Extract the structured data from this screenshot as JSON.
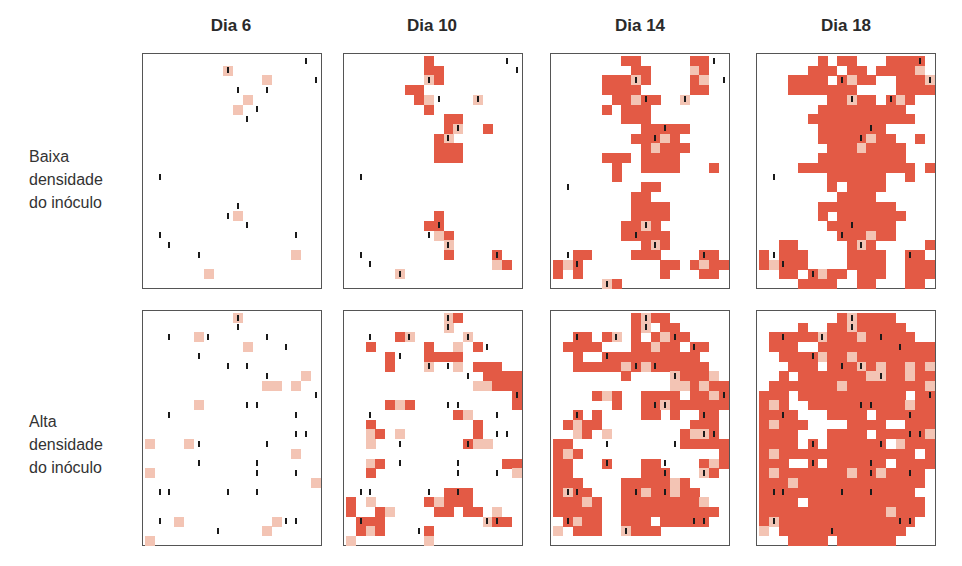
{
  "column_titles": [
    "Dia 6",
    "Dia 10",
    "Dia 14",
    "Dia 18"
  ],
  "row_labels": [
    [
      "Baixa",
      "densidade",
      "do inóculo"
    ],
    [
      "Alta",
      "densidade",
      "do inóculo"
    ]
  ],
  "colors": {
    "infected": "#e35a45",
    "initial_lesion": "#f3c4b4",
    "inoculum_mark": "#1a1a1a",
    "border": "#555555"
  },
  "grid": {
    "cols": 18,
    "rows": 24
  },
  "legend_codes": {
    ".": "healthy",
    "R": "infected",
    "P": "initial infection"
  },
  "panels": [
    [
      {
        "cells": [
          "..................",
          "........P.........",
          "............P.....",
          "..................",
          "..........P.......",
          ".........P........",
          "..................",
          "..................",
          "..................",
          "..................",
          "..................",
          "..................",
          "..................",
          "..................",
          "..................",
          "..................",
          ".........P........",
          "..................",
          "..................",
          "..................",
          "...............P..",
          "..................",
          "......P...........",
          ".................."
        ],
        "ticks": [
          [
            16,
            0
          ],
          [
            8,
            1
          ],
          [
            17,
            2
          ],
          [
            9,
            3
          ],
          [
            12,
            3
          ],
          [
            11,
            5
          ],
          [
            10,
            6
          ],
          [
            1,
            12
          ],
          [
            9,
            15
          ],
          [
            8,
            16
          ],
          [
            10,
            17
          ],
          [
            1,
            18
          ],
          [
            15,
            18
          ],
          [
            2,
            19
          ],
          [
            5,
            20
          ]
        ]
      },
      {
        "cells": [
          "........R.........",
          "........RR........",
          "........PR........",
          "......RR..........",
          ".......RP....P....",
          "........R.........",
          "..........RR......",
          "..........RP..R...",
          ".........RP.......",
          ".........RRR......",
          ".........RRR......",
          "..................",
          "..................",
          "..................",
          "..................",
          "..................",
          ".........R........",
          "........RR........",
          ".........PR.......",
          "..........P.......",
          "..........R....R..",
          "...............PR.",
          ".....P............",
          ".................."
        ],
        "ticks": [
          [
            16,
            0
          ],
          [
            17,
            1
          ],
          [
            8,
            2
          ],
          [
            9,
            4
          ],
          [
            13,
            4
          ],
          [
            11,
            7
          ],
          [
            10,
            8
          ],
          [
            1,
            12
          ],
          [
            9,
            17
          ],
          [
            8,
            18
          ],
          [
            10,
            19
          ],
          [
            1,
            20
          ],
          [
            15,
            20
          ],
          [
            2,
            21
          ],
          [
            5,
            22
          ]
        ]
      },
      {
        "cells": [
          ".......RR.....RR..",
          "........RR....PR..",
          ".....RRRPR....RP..",
          ".....RRRR.....RR..",
          "......RRPRR..P....",
          ".....R.RRR........",
          ".......RRR........",
          ".........RRRRR....",
          "........RRRPR.....",
          ".........RPRRR....",
          ".....RRR.RRRR.....",
          "......R..RRRR...R.",
          "......R...........",
          ".........RR.......",
          "........RR........",
          "........RRRR......",
          "........RRRR......",
          ".......RRPR.......",
          ".......RRRRR......",
          ".........RPR......",
          "..RR....RRR....RR.",
          "RPR........RR.RPRR",
          "R.R........R...RR.",
          ".....PR..........."
        ],
        "ticks": [
          [
            16,
            0
          ],
          [
            8,
            2
          ],
          [
            17,
            2
          ],
          [
            9,
            4
          ],
          [
            13,
            4
          ],
          [
            11,
            7
          ],
          [
            10,
            8
          ],
          [
            1,
            13
          ],
          [
            9,
            17
          ],
          [
            8,
            18
          ],
          [
            10,
            19
          ],
          [
            1,
            20
          ],
          [
            15,
            20
          ],
          [
            2,
            21
          ],
          [
            5,
            23
          ]
        ]
      },
      {
        "cells": [
          "......R.RR...RRRR.",
          ".....RRR.RR.RRRRP.",
          "...RRRR.RPRR..RRRP",
          "...RRRRRRR....RRRR",
          ".......RRPRR.RPR..",
          "......RRRRRRRRR...",
          ".....RRRRRRRRRRR..",
          "......RRRRRRR.....",
          "......RRRRRPRR..R.",
          ".......RRRPRRRR...",
          "......RRRRRRRRR...",
          "....RRRRRRRRRRRR.R",
          ".......RRRRRR..R..",
          ".......R.RRRR.....",
          "........RRRR......",
          "......RRRRRRRR....",
          "......R.RRRRRRR...",
          ".......RRRRRRR....",
          "........RRRPRR....",
          "..RR.....RPR.....RR",
          "R.RRR....RRRR..RR.",
          "RPRRR....RRRR..RRR",
          "..RR.RPRR.RRR..RRR",
          "....RRRR..RR...RR."
        ],
        "ticks": [
          [
            16,
            0
          ],
          [
            8,
            2
          ],
          [
            17,
            2
          ],
          [
            9,
            4
          ],
          [
            13,
            4
          ],
          [
            11,
            7
          ],
          [
            10,
            8
          ],
          [
            1,
            12
          ],
          [
            9,
            17
          ],
          [
            8,
            18
          ],
          [
            10,
            19
          ],
          [
            1,
            20
          ],
          [
            15,
            20
          ],
          [
            2,
            21
          ],
          [
            5,
            22
          ]
        ]
      }
    ],
    [
      {
        "cells": [
          ".........P........",
          "..................",
          ".....P............",
          "..........P.......",
          "..................",
          "..................",
          "................P.",
          "............PP.P..",
          "..................",
          ".....P............",
          "..................",
          "..................",
          "..................",
          "P...P.............",
          "...............P..",
          "..................",
          "P.................",
          ".................P",
          "..................",
          "..................",
          "..................",
          "...P.........P....",
          "............P.....",
          "P................."
        ],
        "ticks": [
          [
            9,
            0
          ],
          [
            9,
            1
          ],
          [
            2,
            2
          ],
          [
            6,
            2
          ],
          [
            12,
            2
          ],
          [
            14,
            3
          ],
          [
            5,
            4
          ],
          [
            8,
            5
          ],
          [
            10,
            5
          ],
          [
            12,
            6
          ],
          [
            17,
            8
          ],
          [
            10,
            9
          ],
          [
            11,
            9
          ],
          [
            2,
            10
          ],
          [
            15,
            10
          ],
          [
            15,
            12
          ],
          [
            16,
            12
          ],
          [
            5,
            13
          ],
          [
            12,
            13
          ],
          [
            5,
            15
          ],
          [
            11,
            15
          ],
          [
            11,
            16
          ],
          [
            15,
            16
          ],
          [
            1,
            18
          ],
          [
            2,
            18
          ],
          [
            8,
            18
          ],
          [
            11,
            18
          ],
          [
            1,
            21
          ],
          [
            14,
            21
          ],
          [
            15,
            21
          ],
          [
            7,
            22
          ]
        ]
      },
      {
        "cells": [
          "..........PR......",
          "..........P.......",
          ".....RP.....P.....",
          "..R.....R..P.R....",
          "....R...RRRR......",
          "....R...P..P.RRR..",
          "..............RRRR",
          ".............PPRRRR",
          ".................R",
          "....RPR..........R",
          "...........RP.....",
          "..R..........R....",
          "..PR.P.......R....",
          "..P.........RPP...",
          "..................",
          "..PR............RR",
          "..R..............P",
          "..................",
          "..........RRR.....",
          "R.P.....RPRRR.....",
          "R..RP....RR.RR.P..",
          ".RRR..........PRR.",
          ".RPR....R.........",
          "P.......P........."
        ],
        "ticks": [
          [
            10,
            0
          ],
          [
            10,
            1
          ],
          [
            2,
            2
          ],
          [
            6,
            2
          ],
          [
            12,
            2
          ],
          [
            14,
            3
          ],
          [
            5,
            4
          ],
          [
            8,
            5
          ],
          [
            10,
            5
          ],
          [
            12,
            6
          ],
          [
            17,
            8
          ],
          [
            10,
            9
          ],
          [
            11,
            9
          ],
          [
            2,
            10
          ],
          [
            15,
            10
          ],
          [
            15,
            12
          ],
          [
            16,
            12
          ],
          [
            5,
            13
          ],
          [
            12,
            13
          ],
          [
            5,
            15
          ],
          [
            11,
            15
          ],
          [
            11,
            16
          ],
          [
            15,
            16
          ],
          [
            1,
            18
          ],
          [
            2,
            18
          ],
          [
            8,
            18
          ],
          [
            11,
            18
          ],
          [
            1,
            21
          ],
          [
            14,
            21
          ],
          [
            15,
            21
          ],
          [
            7,
            22
          ]
        ]
      },
      {
        "cells": [
          "........RPRR......",
          "........RP.RR.....",
          "..RR.RP.R.RPRR....",
          ".RRRR...RRPRR.RR..",
          "..R..RRRRRRRRRR...",
          "..RRRRRPRPRRRRRR..",
          ".......R....PRRRP.",
          "............PPRPRR",
          "....RPR..RRRR.RRPR",
          "......R..RRPRRRRRR",
          "..R.R....RR.R..RR.",
          ".RPRR.........RRR.",
          "..PR.P.......RPPR.",
          "RR...........RRRRR",
          "RPR..............R",
          "RR...R...RR....RPR",
          "RR.......RRR...PR.",
          "RRR....RRRRRPR....",
          "RPRR...RRPRRPRR...",
          "RRRPR..RRRRRRRRP..",
          "RRRRR..RRRRRRRRRR.",
          ".RPRR..RRR.RRRRR..",
          "P.RRR..PRRR.......",
          ".................."
        ],
        "ticks": [
          [
            9,
            0
          ],
          [
            9,
            1
          ],
          [
            2,
            2
          ],
          [
            6,
            2
          ],
          [
            12,
            2
          ],
          [
            14,
            3
          ],
          [
            5,
            4
          ],
          [
            8,
            5
          ],
          [
            10,
            5
          ],
          [
            12,
            6
          ],
          [
            17,
            8
          ],
          [
            10,
            9
          ],
          [
            11,
            9
          ],
          [
            2,
            10
          ],
          [
            15,
            10
          ],
          [
            15,
            12
          ],
          [
            16,
            12
          ],
          [
            5,
            13
          ],
          [
            12,
            13
          ],
          [
            5,
            15
          ],
          [
            11,
            15
          ],
          [
            11,
            16
          ],
          [
            15,
            16
          ],
          [
            1,
            18
          ],
          [
            2,
            18
          ],
          [
            8,
            18
          ],
          [
            11,
            18
          ],
          [
            1,
            21
          ],
          [
            14,
            21
          ],
          [
            15,
            21
          ],
          [
            7,
            22
          ]
        ]
      },
      {
        "cells": [
          "........RPRRRR....",
          "....R..RRPRRRRR...",
          ".RRRRRPRRRPRRRRR..",
          ".RRR..RRRRRRRRRRRR",
          "..RRRRPRRPRRRRRRRR",
          "...RRR.RRRPRPRRPRP",
          "..R.RRRRRRRPPRRPRR",
          ".RRRRRRRPRRRRRRRRP",
          "RRR.RRRRRRRRRRR.RR",
          "RPR..RRRRRRRRRRPRR",
          "RRRR...RRRR.RRRRRR",
          "RPRRR....RRRR..RRR",
          "RRRR...RRRR.RRRRRP",
          "RRRR.R.RRRRRR.PRRR",
          "RPRRRRRRRRRRRRRR.R",
          "RRR..R.RRRRRR.RRRR",
          "RPRRRRRRRPRRPRRRR.",
          "RRRPRRRRRRRRRRRRR.",
          "RRRRRRRRRRRRRRRR..",
          "RRRR.RRRRRRRRRRRR.",
          "RRRRRRRRRRRRRPRRR.",
          "RPRRRRRRRRRRRRRR..",
          "P.RRRRRRRRRRRRR...",
          "...RRRR.RRRRRR...."
        ],
        "ticks": [
          [
            9,
            0
          ],
          [
            9,
            1
          ],
          [
            2,
            2
          ],
          [
            6,
            2
          ],
          [
            12,
            2
          ],
          [
            14,
            3
          ],
          [
            5,
            4
          ],
          [
            8,
            5
          ],
          [
            10,
            5
          ],
          [
            12,
            6
          ],
          [
            17,
            8
          ],
          [
            10,
            9
          ],
          [
            11,
            9
          ],
          [
            2,
            10
          ],
          [
            15,
            10
          ],
          [
            15,
            12
          ],
          [
            16,
            12
          ],
          [
            5,
            13
          ],
          [
            12,
            13
          ],
          [
            5,
            15
          ],
          [
            11,
            15
          ],
          [
            11,
            16
          ],
          [
            15,
            16
          ],
          [
            1,
            18
          ],
          [
            2,
            18
          ],
          [
            8,
            18
          ],
          [
            11,
            18
          ],
          [
            1,
            21
          ],
          [
            14,
            21
          ],
          [
            15,
            21
          ],
          [
            7,
            22
          ]
        ]
      }
    ]
  ]
}
